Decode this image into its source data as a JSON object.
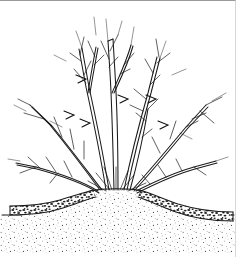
{
  "figure": {
    "alt_text": "Line drawing of a dormant multi-stemmed shrub with pruning cuts, growing from a soil mound surrounded by a mulch layer",
    "caption": "",
    "background_color": "#ffffff",
    "ink_color": "#1a1a1a"
  },
  "scene": {
    "plant": {
      "name": "shrub",
      "label": "multi-stemmed deciduous shrub",
      "stem_count": 7,
      "base_point_x": 116,
      "base_point_y": 190,
      "canopy_top_y": 12,
      "canopy_left_x": 14,
      "canopy_right_x": 226,
      "pruning_cut_count": 6
    },
    "ground": {
      "name": "soil-mound",
      "label": "raised soil mound",
      "grade_line_y": 213,
      "mound_peak_x": 116,
      "mound_peak_y": 190,
      "texture": "fine stipple"
    },
    "mulch": {
      "name": "mulch-layer",
      "label": "coarse mulch layer",
      "left_span_x": [
        10,
        92
      ],
      "right_span_x": [
        142,
        233
      ],
      "band_thickness": 9,
      "texture": "coarse speckle"
    }
  },
  "legend": {
    "items": [
      {
        "key": "shrub",
        "label": "multi-stemmed deciduous shrub"
      },
      {
        "key": "pruning-cut",
        "label": "pruning cut"
      },
      {
        "key": "soil-mound",
        "label": "raised soil mound"
      },
      {
        "key": "mulch-layer",
        "label": "coarse mulch layer"
      }
    ]
  }
}
